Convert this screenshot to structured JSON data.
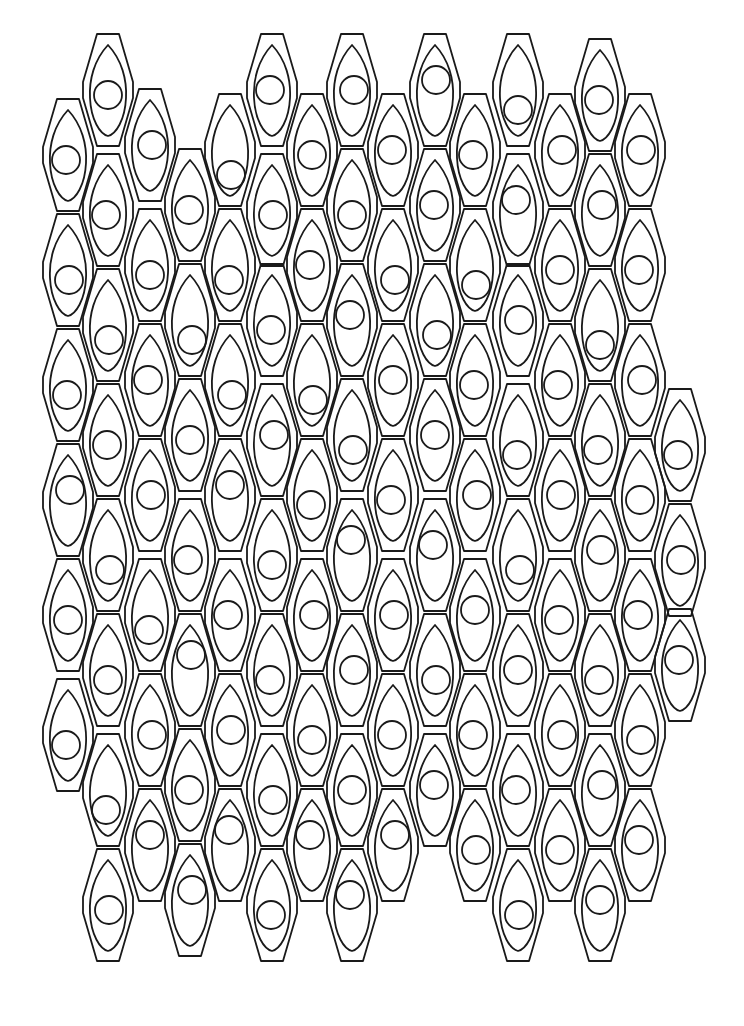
{
  "artwork": {
    "type": "line-art pattern",
    "description": "Tessellated elongated hexagon cells, each containing a teardrop outline and a circle",
    "stroke_color": "#1a1a1a",
    "background_color": "#ffffff",
    "cell": {
      "width": 50,
      "height": 112,
      "circle_radius": 14
    },
    "columns": [
      {
        "x": 68,
        "centers": [
          155,
          270,
          385,
          500,
          615,
          735
        ],
        "circle_dy": [
          5,
          10,
          10,
          -10,
          5,
          10
        ]
      },
      {
        "x": 108,
        "centers": [
          90,
          210,
          325,
          440,
          555,
          670,
          790,
          905
        ],
        "circle_dy": [
          5,
          5,
          15,
          5,
          15,
          10,
          20,
          5
        ]
      },
      {
        "x": 150,
        "centers": [
          145,
          265,
          380,
          495,
          615,
          730,
          845
        ],
        "circle_dy": [
          0,
          10,
          0,
          0,
          15,
          5,
          -10
        ]
      },
      {
        "x": 190,
        "centers": [
          205,
          320,
          435,
          555,
          670,
          785,
          900
        ],
        "circle_dy": [
          5,
          20,
          5,
          5,
          -15,
          5,
          -10
        ]
      },
      {
        "x": 230,
        "centers": [
          150,
          265,
          380,
          495,
          615,
          730,
          845
        ],
        "circle_dy": [
          25,
          15,
          15,
          -10,
          0,
          0,
          -15
        ]
      },
      {
        "x": 272,
        "centers": [
          90,
          210,
          320,
          440,
          555,
          670,
          790,
          905
        ],
        "circle_dy": [
          0,
          5,
          10,
          -5,
          10,
          10,
          10,
          10
        ]
      },
      {
        "x": 312,
        "centers": [
          150,
          265,
          380,
          495,
          615,
          730,
          845
        ],
        "circle_dy": [
          5,
          0,
          20,
          10,
          0,
          10,
          -10
        ]
      },
      {
        "x": 352,
        "centers": [
          90,
          205,
          320,
          435,
          555,
          670,
          790,
          905
        ],
        "circle_dy": [
          0,
          10,
          -5,
          15,
          -15,
          0,
          0,
          -10
        ]
      },
      {
        "x": 393,
        "centers": [
          150,
          265,
          380,
          495,
          615,
          730,
          845
        ],
        "circle_dy": [
          0,
          15,
          0,
          5,
          0,
          5,
          -10
        ]
      },
      {
        "x": 435,
        "centers": [
          90,
          205,
          320,
          435,
          555,
          670,
          790
        ],
        "circle_dy": [
          -10,
          0,
          15,
          0,
          -10,
          10,
          -5
        ]
      },
      {
        "x": 475,
        "centers": [
          150,
          265,
          380,
          495,
          615,
          730,
          845
        ],
        "circle_dy": [
          5,
          20,
          5,
          0,
          -5,
          5,
          5
        ]
      },
      {
        "x": 518,
        "centers": [
          90,
          210,
          320,
          440,
          555,
          670,
          790,
          905
        ],
        "circle_dy": [
          20,
          -10,
          0,
          15,
          15,
          0,
          0,
          10
        ]
      },
      {
        "x": 560,
        "centers": [
          150,
          265,
          380,
          495,
          615,
          730,
          845
        ],
        "circle_dy": [
          0,
          5,
          5,
          0,
          5,
          5,
          5
        ]
      },
      {
        "x": 600,
        "centers": [
          95,
          210,
          325,
          440,
          555,
          670,
          790,
          905
        ],
        "circle_dy": [
          5,
          -5,
          20,
          10,
          -5,
          10,
          -5,
          -5
        ]
      },
      {
        "x": 640,
        "centers": [
          150,
          265,
          380,
          495,
          615,
          730,
          845
        ],
        "circle_dy": [
          0,
          5,
          0,
          5,
          0,
          10,
          -5
        ]
      },
      {
        "x": 680,
        "centers": [
          445,
          560,
          665
        ],
        "circle_dy": [
          10,
          0,
          -5
        ]
      }
    ]
  }
}
